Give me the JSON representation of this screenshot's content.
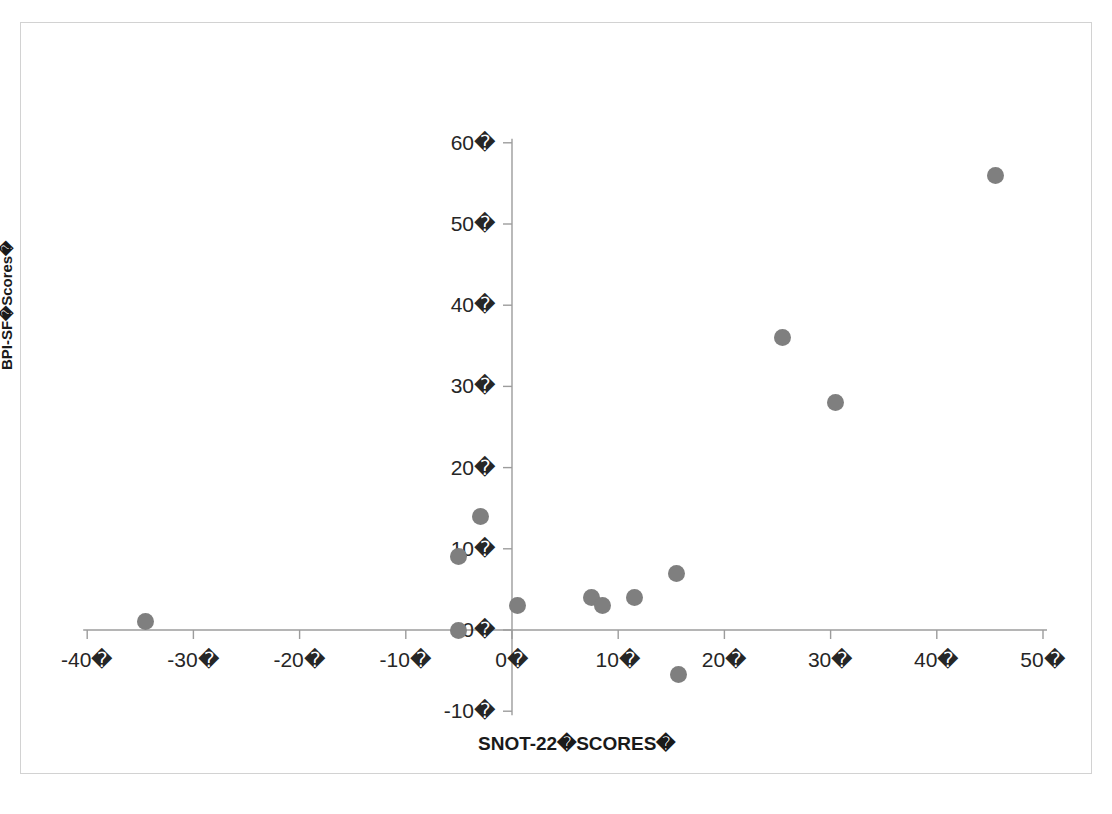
{
  "chart_data": {
    "type": "scatter",
    "title": "",
    "xlabel": "SNOT-22�SCORES�",
    "ylabel": "BPI-SF�Scores�",
    "xlim": [
      -45,
      50
    ],
    "ylim": [
      -10,
      60
    ],
    "grid": false,
    "legend": null,
    "marker_color": "#7f7f7f",
    "x_ticks": [
      -40,
      -30,
      -20,
      -10,
      0,
      10,
      20,
      30,
      40,
      50
    ],
    "y_ticks": [
      -10,
      0,
      10,
      20,
      30,
      40,
      50,
      60
    ],
    "x_tick_labels": [
      "-40�",
      "-30�",
      "-20�",
      "-10�",
      "0�",
      "10�",
      "20�",
      "30�",
      "40�",
      "50�"
    ],
    "y_tick_labels": [
      "-10�",
      "0�",
      "10�",
      "20�",
      "30�",
      "40�",
      "50�",
      "60�"
    ],
    "series": [
      {
        "name": "patients",
        "points": [
          [
            -34.5,
            1
          ],
          [
            -5,
            0
          ],
          [
            -5,
            9
          ],
          [
            -3,
            14
          ],
          [
            0.5,
            3
          ],
          [
            7.5,
            4
          ],
          [
            8.5,
            3
          ],
          [
            11.5,
            4
          ],
          [
            15.5,
            7
          ],
          [
            15.7,
            -5.5
          ],
          [
            25.5,
            36
          ],
          [
            30.5,
            28
          ],
          [
            45.5,
            56
          ]
        ]
      }
    ]
  },
  "axis_titles": {
    "x": "SNOT-22�SCORES�",
    "y": "BPI-SF�Scores�"
  }
}
